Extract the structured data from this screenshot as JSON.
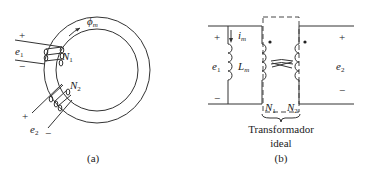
{
  "figure_a": {
    "caption": "(a)",
    "flux_label": "ϕ",
    "flux_sub": "m",
    "winding1": {
      "label": "N",
      "sub": "1",
      "voltage": "e",
      "voltage_sub": "1",
      "plus": "+",
      "minus": "−"
    },
    "winding2": {
      "label": "N",
      "sub": "2",
      "voltage": "e",
      "voltage_sub": "2",
      "plus": "+",
      "minus": "−"
    }
  },
  "figure_b": {
    "caption": "(b)",
    "left_voltage": "e",
    "left_voltage_sub": "1",
    "right_voltage": "e",
    "right_voltage_sub": "2",
    "plus": "+",
    "minus": "−",
    "current_label": "i",
    "current_sub": "m",
    "inductor_label": "L",
    "inductor_sub": "m",
    "n1_label": "N",
    "n1_sub": "1",
    "n2_label": "N",
    "n2_sub": "2",
    "ideal_label_line1": "Transformador",
    "ideal_label_line2": "ideal"
  },
  "colors": {
    "line": "#333333",
    "text": "#222222",
    "background": "#ffffff"
  }
}
